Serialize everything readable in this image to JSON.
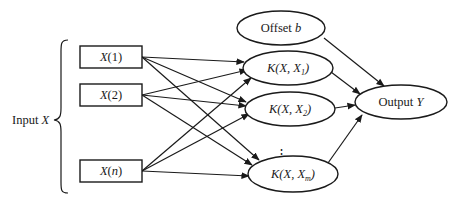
{
  "diagram": {
    "type": "kernel-network",
    "input_group": {
      "label_prefix": "Input ",
      "label_var": "X"
    },
    "inputs": [
      {
        "id": "x1",
        "var": "X",
        "arg": "(1)"
      },
      {
        "id": "x2",
        "var": "X",
        "arg": "(2)"
      },
      {
        "id": "xn",
        "var": "X",
        "arg_open": "(",
        "arg_var": "n",
        "arg_close": ")"
      }
    ],
    "kernels": [
      {
        "id": "k1",
        "text": "K(X, X",
        "sub": "1",
        "close": ")"
      },
      {
        "id": "k2",
        "text": "K(X, X",
        "sub": "2",
        "close": ")"
      },
      {
        "id": "km",
        "text": "K(X, X",
        "sub": "m",
        "close": ")"
      }
    ],
    "ellipsis": "⋮",
    "offset": {
      "prefix": "Offset ",
      "var": "b"
    },
    "output": {
      "prefix": "Output ",
      "var": "Y"
    },
    "edges": [
      [
        "x1",
        "k1"
      ],
      [
        "x1",
        "k2"
      ],
      [
        "x1",
        "km"
      ],
      [
        "x2",
        "k1"
      ],
      [
        "x2",
        "k2"
      ],
      [
        "x2",
        "km"
      ],
      [
        "xn",
        "k1"
      ],
      [
        "xn",
        "k2"
      ],
      [
        "xn",
        "km"
      ],
      [
        "offset",
        "output"
      ],
      [
        "k1",
        "output"
      ],
      [
        "k2",
        "output"
      ],
      [
        "km",
        "output"
      ]
    ],
    "colors": {
      "stroke": "#1a1a1a",
      "background": "#ffffff"
    }
  }
}
